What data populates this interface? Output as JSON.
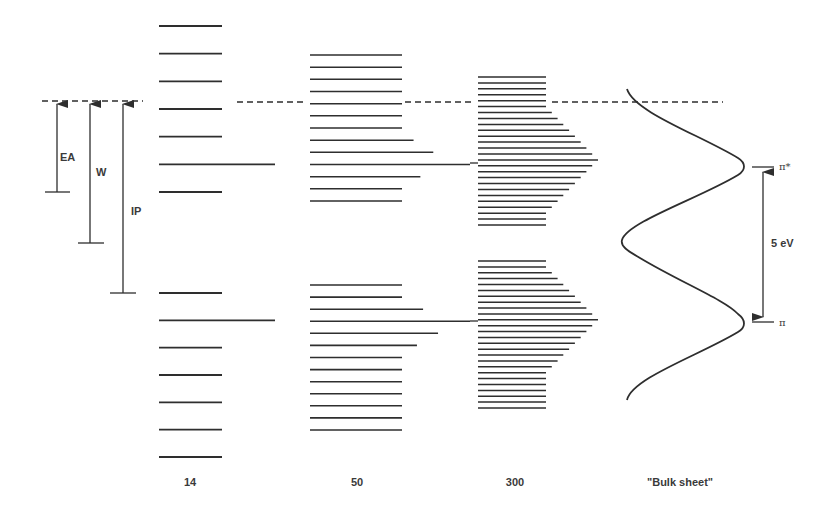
{
  "diagram": {
    "colors": {
      "ink": "#2e2e2e",
      "text": "#3a3a3a",
      "background": "#ffffff"
    },
    "left_annotations": [
      {
        "id": "ea",
        "label": "EA"
      },
      {
        "id": "w",
        "label": "W"
      },
      {
        "id": "ip",
        "label": "IP"
      }
    ],
    "columns": [
      {
        "id": "14",
        "label": "14",
        "upper_band": {
          "levels": 7,
          "extended_level_index": 5,
          "profile": [
            0,
            0,
            0,
            0,
            0,
            1,
            0
          ]
        },
        "lower_band": {
          "levels": 7,
          "extended_level_index": 1,
          "profile": [
            0,
            1,
            0,
            0,
            0,
            0,
            0
          ]
        }
      },
      {
        "id": "50",
        "label": "50",
        "upper_band": {
          "levels": 13,
          "profile": [
            0,
            0,
            0,
            0,
            0,
            0,
            0,
            0.17,
            0.46,
            1,
            0.27,
            0,
            0
          ]
        },
        "lower_band": {
          "levels": 13,
          "profile": [
            0,
            0,
            0.31,
            1,
            0.53,
            0.22,
            0,
            0,
            0,
            0,
            0,
            0,
            0
          ]
        }
      },
      {
        "id": "300",
        "label": "300",
        "upper_band": {
          "levels": 26,
          "peak_level_index": 14
        },
        "lower_band": {
          "levels": 26,
          "peak_level_index": 10
        }
      },
      {
        "id": "bulk",
        "label": "\"Bulk sheet\""
      }
    ],
    "gap": {
      "upper_label": "π*",
      "lower_label": "π",
      "value_label": "5 eV"
    }
  }
}
